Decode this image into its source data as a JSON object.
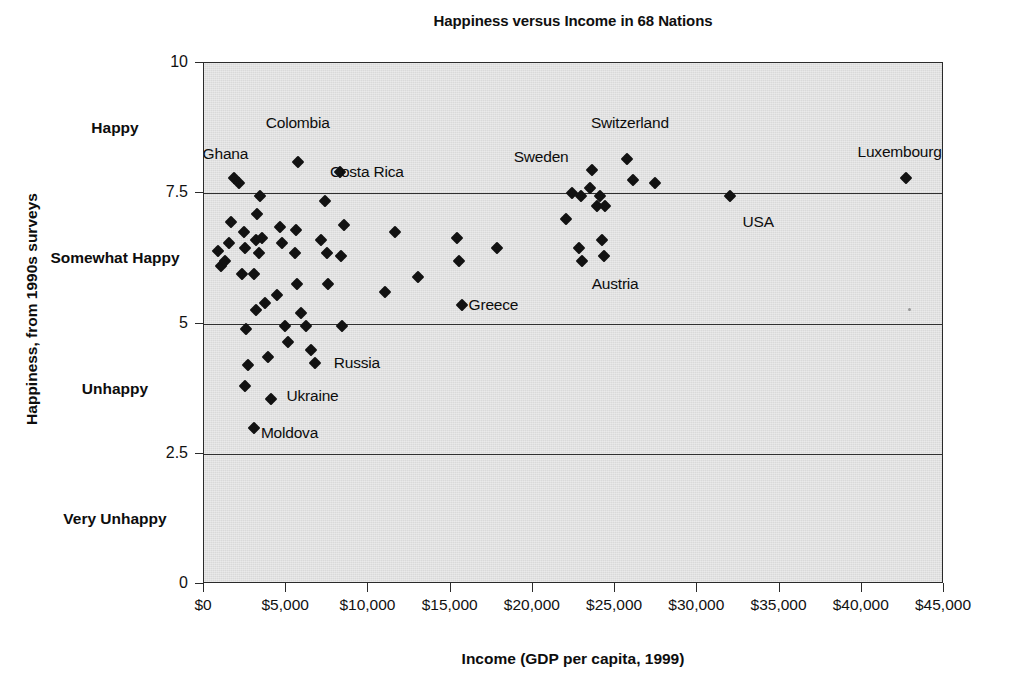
{
  "chart_data": {
    "type": "scatter",
    "title": "Happiness versus Income in 68 Nations",
    "xlabel": "Income (GDP per capita, 1999)",
    "ylabel": "Happiness, from 1990s surveys",
    "xlim": [
      0,
      45000
    ],
    "ylim": [
      0,
      10
    ],
    "grid": true,
    "legend": "none",
    "xticks": [
      0,
      5000,
      10000,
      15000,
      20000,
      25000,
      30000,
      35000,
      40000,
      45000
    ],
    "xticklabels": [
      "$0",
      "$5,000",
      "$10,000",
      "$15,000",
      "$20,000",
      "$25,000",
      "$30,000",
      "$35,000",
      "$40,000",
      "$45,000"
    ],
    "yticks": [
      0,
      2.5,
      5,
      7.5,
      10
    ],
    "yticklabels": [
      "0",
      "2.5",
      "5",
      "7.5",
      "10"
    ],
    "y_category_labels": [
      {
        "text": "Happy",
        "value": 8.75
      },
      {
        "text": "Somewhat Happy",
        "value": 6.25
      },
      {
        "text": "Unhappy",
        "value": 3.75
      },
      {
        "text": "Very Unhappy",
        "value": 1.25
      }
    ],
    "gridlines_y": [
      2.5,
      5,
      7.5
    ],
    "points": [
      {
        "x": 850,
        "y": 6.4
      },
      {
        "x": 1050,
        "y": 6.1
      },
      {
        "x": 1800,
        "y": 7.8
      },
      {
        "x": 2150,
        "y": 7.7
      },
      {
        "x": 1650,
        "y": 6.95
      },
      {
        "x": 1500,
        "y": 6.55
      },
      {
        "x": 1250,
        "y": 6.2
      },
      {
        "x": 2450,
        "y": 6.75
      },
      {
        "x": 2500,
        "y": 6.45
      },
      {
        "x": 2300,
        "y": 5.95
      },
      {
        "x": 2550,
        "y": 4.9
      },
      {
        "x": 2650,
        "y": 4.2
      },
      {
        "x": 2500,
        "y": 3.8
      },
      {
        "x": 3050,
        "y": 3.0
      },
      {
        "x": 3400,
        "y": 7.45
      },
      {
        "x": 3200,
        "y": 7.1
      },
      {
        "x": 3150,
        "y": 6.6
      },
      {
        "x": 3550,
        "y": 6.65
      },
      {
        "x": 3350,
        "y": 6.35
      },
      {
        "x": 3050,
        "y": 5.95
      },
      {
        "x": 3150,
        "y": 5.25
      },
      {
        "x": 3700,
        "y": 5.4
      },
      {
        "x": 3900,
        "y": 4.35
      },
      {
        "x": 4100,
        "y": 3.55
      },
      {
        "x": 4600,
        "y": 6.85
      },
      {
        "x": 4750,
        "y": 6.55
      },
      {
        "x": 4450,
        "y": 5.55
      },
      {
        "x": 4900,
        "y": 4.95
      },
      {
        "x": 5100,
        "y": 4.65
      },
      {
        "x": 5700,
        "y": 8.1
      },
      {
        "x": 5600,
        "y": 6.8
      },
      {
        "x": 5550,
        "y": 6.35
      },
      {
        "x": 5650,
        "y": 5.75
      },
      {
        "x": 5900,
        "y": 5.2
      },
      {
        "x": 6200,
        "y": 4.95
      },
      {
        "x": 6500,
        "y": 4.5
      },
      {
        "x": 6750,
        "y": 4.25
      },
      {
        "x": 7100,
        "y": 6.6
      },
      {
        "x": 7350,
        "y": 7.35
      },
      {
        "x": 7450,
        "y": 6.35
      },
      {
        "x": 7550,
        "y": 5.75
      },
      {
        "x": 8300,
        "y": 7.9
      },
      {
        "x": 8500,
        "y": 6.9
      },
      {
        "x": 8350,
        "y": 6.3
      },
      {
        "x": 8400,
        "y": 4.95
      },
      {
        "x": 11000,
        "y": 5.6
      },
      {
        "x": 11600,
        "y": 6.75
      },
      {
        "x": 13000,
        "y": 5.9
      },
      {
        "x": 15400,
        "y": 6.65
      },
      {
        "x": 15500,
        "y": 6.2
      },
      {
        "x": 15700,
        "y": 5.35
      },
      {
        "x": 17800,
        "y": 6.45
      },
      {
        "x": 22000,
        "y": 7.0
      },
      {
        "x": 22400,
        "y": 7.5
      },
      {
        "x": 22900,
        "y": 7.45
      },
      {
        "x": 22800,
        "y": 6.45
      },
      {
        "x": 23000,
        "y": 6.2
      },
      {
        "x": 23600,
        "y": 7.95
      },
      {
        "x": 23500,
        "y": 7.6
      },
      {
        "x": 24100,
        "y": 7.45
      },
      {
        "x": 23900,
        "y": 7.25
      },
      {
        "x": 24400,
        "y": 7.25
      },
      {
        "x": 24200,
        "y": 6.6
      },
      {
        "x": 24300,
        "y": 6.3
      },
      {
        "x": 25700,
        "y": 8.15
      },
      {
        "x": 26100,
        "y": 7.75
      },
      {
        "x": 27400,
        "y": 7.7
      },
      {
        "x": 32000,
        "y": 7.45
      },
      {
        "x": 42700,
        "y": 7.8
      }
    ],
    "annotations": [
      {
        "label": "Ghana",
        "x": 1300,
        "y": 8.25
      },
      {
        "label": "Colombia",
        "x": 5700,
        "y": 8.85
      },
      {
        "label": "Costa Rica",
        "x": 9900,
        "y": 7.9
      },
      {
        "label": "Sweden",
        "x": 20500,
        "y": 8.2
      },
      {
        "label": "Switzerland",
        "x": 25900,
        "y": 8.85
      },
      {
        "label": "Luxembourg",
        "x": 42300,
        "y": 8.3
      },
      {
        "label": "USA",
        "x": 33700,
        "y": 6.95
      },
      {
        "label": "Austria",
        "x": 25000,
        "y": 5.75
      },
      {
        "label": "Greece",
        "x": 17600,
        "y": 5.35
      },
      {
        "label": "Russia",
        "x": 9300,
        "y": 4.25
      },
      {
        "label": "Ukraine",
        "x": 6600,
        "y": 3.6
      },
      {
        "label": "Moldova",
        "x": 5200,
        "y": 2.9
      }
    ]
  }
}
